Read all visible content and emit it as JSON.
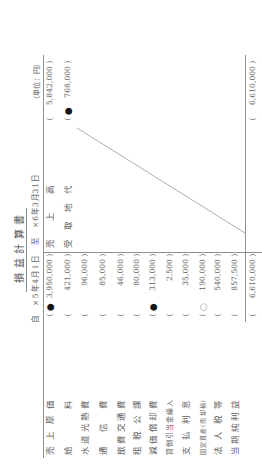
{
  "document": {
    "title": "損益計算書",
    "period": {
      "from_label": "自",
      "from_date": "×5年4月1日",
      "to_label": "至",
      "to_date": "×6年3月31日"
    },
    "unit": "（単位：円）"
  },
  "brackets": {
    "open": "(",
    "close": ")"
  },
  "debit": {
    "rows": [
      {
        "label": "売上原価",
        "amount": "3,950,000",
        "mark": "●"
      },
      {
        "label": "給料",
        "amount": "421,000"
      },
      {
        "label": "水道光熱費",
        "amount": "96,000"
      },
      {
        "label": "通信費",
        "amount": "85,000"
      },
      {
        "label": "旅費交通費",
        "amount": "46,000"
      },
      {
        "label": "租税公課",
        "amount": "80,000"
      },
      {
        "label": "減価償却費",
        "amount": "313,000",
        "mark": "●"
      },
      {
        "label": "貸倒引当金繰入",
        "amount": "2,500"
      },
      {
        "label": "支払利息",
        "amount": "35,000"
      },
      {
        "label": "固定資産(売却損)",
        "amount": "190,000",
        "mark": "○"
      },
      {
        "label": "法人税等",
        "amount": "540,000"
      },
      {
        "label": "当期純利益",
        "amount": "857,500"
      }
    ],
    "total": "6,610,000"
  },
  "credit": {
    "rows": [
      {
        "label": "売上高",
        "amount": "5,842,000"
      },
      {
        "label": "受取地代",
        "amount": "768,000",
        "mark": "●"
      }
    ],
    "total": "6,610,000"
  }
}
